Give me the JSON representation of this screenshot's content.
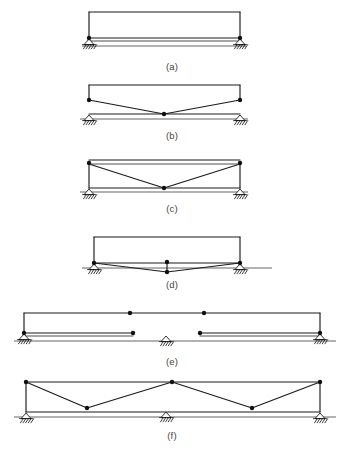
{
  "figure": {
    "background_color": "#ffffff",
    "line_color": "#1a1a1a",
    "joint_color": "#101010",
    "caption_color": "#444444",
    "width": 347,
    "height": 449
  },
  "diagrams": [
    {
      "id": "a",
      "caption": "(a)",
      "caption_pos": {
        "x": 172,
        "y": 70
      },
      "description": "simply supported beam with top arch chord",
      "ground_line": {
        "x1": 82,
        "y1": 46,
        "x2": 246,
        "y2": 46
      },
      "members": [
        {
          "name": "top-chord",
          "points": "89,12 240,12"
        },
        {
          "name": "left-post",
          "points": "89,12 89,38"
        },
        {
          "name": "right-post",
          "points": "240,12 240,38"
        },
        {
          "name": "bottom-chord-upper",
          "points": "89,38 240,38"
        },
        {
          "name": "bottom-chord-lower",
          "points": "89,41 240,41"
        }
      ],
      "joints": [
        {
          "name": "joint-left",
          "x": 89,
          "y": 38
        },
        {
          "name": "joint-right",
          "x": 240,
          "y": 38
        }
      ],
      "supports": [
        {
          "name": "support-left-pin",
          "x": 89,
          "y": 39,
          "type": "pin"
        },
        {
          "name": "support-right-pin",
          "x": 240,
          "y": 39,
          "type": "pin"
        }
      ]
    },
    {
      "id": "b",
      "caption": "(b)",
      "caption_pos": {
        "x": 172,
        "y": 139
      },
      "description": "trussed beam with single depressed centre node",
      "ground_line": {
        "x1": 80,
        "y1": 119,
        "x2": 248,
        "y2": 119
      },
      "members": [
        {
          "name": "top-chord",
          "points": "89,85 240,85"
        },
        {
          "name": "left-post",
          "points": "89,85 89,100"
        },
        {
          "name": "right-post",
          "points": "240,85 240,100"
        },
        {
          "name": "bottom-chord",
          "points": "89,114 240,114"
        },
        {
          "name": "diagonal-left",
          "points": "89,100 164,114"
        },
        {
          "name": "diagonal-right",
          "points": "164,114 240,100"
        }
      ],
      "joints": [
        {
          "name": "joint-left",
          "x": 89,
          "y": 100
        },
        {
          "name": "joint-right",
          "x": 240,
          "y": 100
        },
        {
          "name": "joint-centre",
          "x": 164,
          "y": 114
        }
      ],
      "supports": [
        {
          "name": "support-left-pin",
          "x": 89,
          "y": 115,
          "type": "pin"
        },
        {
          "name": "support-right-roller",
          "x": 240,
          "y": 115,
          "type": "roller"
        }
      ]
    },
    {
      "id": "c",
      "caption": "(c)",
      "caption_pos": {
        "x": 172,
        "y": 212
      },
      "description": "king post truss with vertical end posts to ground",
      "ground_line": {
        "x1": 80,
        "y1": 192,
        "x2": 248,
        "y2": 192
      },
      "members": [
        {
          "name": "top-chord-upper",
          "points": "89,160 240,160"
        },
        {
          "name": "top-chord-lower",
          "points": "89,164 240,164"
        },
        {
          "name": "left-post",
          "points": "89,164 89,188"
        },
        {
          "name": "right-post",
          "points": "240,164 240,188"
        },
        {
          "name": "bottom-chord",
          "points": "89,188 240,188"
        },
        {
          "name": "diagonal-left",
          "points": "89,164 164,188"
        },
        {
          "name": "diagonal-right",
          "points": "164,188 240,164"
        }
      ],
      "joints": [
        {
          "name": "joint-left",
          "x": 89,
          "y": 163
        },
        {
          "name": "joint-right",
          "x": 240,
          "y": 163
        },
        {
          "name": "joint-centre",
          "x": 164,
          "y": 188
        }
      ],
      "supports": [
        {
          "name": "support-left-pin",
          "x": 89,
          "y": 189,
          "type": "pin"
        },
        {
          "name": "support-right-roller",
          "x": 240,
          "y": 189,
          "type": "roller"
        }
      ]
    },
    {
      "id": "d",
      "caption": "(d)",
      "caption_pos": {
        "x": 172,
        "y": 288
      },
      "description": "trussed beam with short vertical hanger at midspan",
      "ground_line": {
        "x1": 82,
        "y1": 268,
        "x2": 272,
        "y2": 268
      },
      "members": [
        {
          "name": "top-chord",
          "points": "94,237 240,237"
        },
        {
          "name": "left-post",
          "points": "94,237 94,263"
        },
        {
          "name": "right-post",
          "points": "240,237 240,263"
        },
        {
          "name": "bottom-chord",
          "points": "94,263 240,263"
        },
        {
          "name": "diagonal-left",
          "points": "94,263 167,272"
        },
        {
          "name": "diagonal-right",
          "points": "167,272 240,263"
        },
        {
          "name": "hanger",
          "points": "167,262 167,272"
        }
      ],
      "joints": [
        {
          "name": "joint-left",
          "x": 94,
          "y": 263
        },
        {
          "name": "joint-right",
          "x": 240,
          "y": 263
        },
        {
          "name": "joint-centre-top",
          "x": 167,
          "y": 262
        },
        {
          "name": "joint-centre-bottom",
          "x": 167,
          "y": 272
        }
      ],
      "supports": [
        {
          "name": "support-left-pin",
          "x": 94,
          "y": 264,
          "type": "pin"
        },
        {
          "name": "support-right-roller",
          "x": 240,
          "y": 264,
          "type": "roller"
        }
      ]
    },
    {
      "id": "e",
      "caption": "(e)",
      "caption_pos": {
        "x": 172,
        "y": 365
      },
      "description": "two span beam with internal hinges and suspended span",
      "ground_line": {
        "x1": 14,
        "y1": 341,
        "x2": 336,
        "y2": 341
      },
      "members": [
        {
          "name": "top-chord-left",
          "points": "24,313 130,313"
        },
        {
          "name": "top-chord-right",
          "points": "204,313 320,313"
        },
        {
          "name": "top-chord-drop-left",
          "points": "24,313 24,333"
        },
        {
          "name": "top-chord-drop-right",
          "points": "320,313 320,333"
        },
        {
          "name": "suspended-top-link",
          "points": "130,313 204,313"
        },
        {
          "name": "bottom-chord-left",
          "points": "24,333 133,333"
        },
        {
          "name": "bottom-chord-right",
          "points": "200,333 320,333"
        },
        {
          "name": "bottom-chord-thin-left",
          "points": "24,336 133,336"
        },
        {
          "name": "bottom-chord-thin-right",
          "points": "200,336 320,336"
        }
      ],
      "joints": [
        {
          "name": "joint-left-support",
          "x": 24,
          "y": 333
        },
        {
          "name": "joint-right-support",
          "x": 320,
          "y": 333
        },
        {
          "name": "joint-hinge-top-left",
          "x": 130,
          "y": 313
        },
        {
          "name": "joint-hinge-top-right",
          "x": 204,
          "y": 313
        },
        {
          "name": "joint-hinge-bottom-left",
          "x": 133,
          "y": 333
        },
        {
          "name": "joint-hinge-bottom-right",
          "x": 200,
          "y": 333
        }
      ],
      "supports": [
        {
          "name": "support-left-pin",
          "x": 24,
          "y": 334,
          "type": "pin"
        },
        {
          "name": "support-middle-roller",
          "x": 166,
          "y": 336,
          "type": "roller"
        },
        {
          "name": "support-right-pin",
          "x": 320,
          "y": 334,
          "type": "pin"
        }
      ]
    },
    {
      "id": "f",
      "caption": "(f)",
      "caption_pos": {
        "x": 172,
        "y": 439
      },
      "description": "W truss with zigzag web over three supports",
      "ground_line": {
        "x1": 14,
        "y1": 417,
        "x2": 336,
        "y2": 417
      },
      "members": [
        {
          "name": "top-chord",
          "points": "26,382 320,382"
        },
        {
          "name": "left-post",
          "points": "26,382 26,412"
        },
        {
          "name": "right-post",
          "points": "320,382 320,412"
        },
        {
          "name": "bottom-chord",
          "points": "26,412 320,412"
        },
        {
          "name": "web-1",
          "points": "26,382 87,408"
        },
        {
          "name": "web-2",
          "points": "87,408 172,382"
        },
        {
          "name": "web-3",
          "points": "172,382 252,408"
        },
        {
          "name": "web-4",
          "points": "252,408 320,382"
        }
      ],
      "joints": [
        {
          "name": "joint-left-top",
          "x": 26,
          "y": 382
        },
        {
          "name": "joint-right-top",
          "x": 320,
          "y": 382
        },
        {
          "name": "joint-apex-centre",
          "x": 172,
          "y": 382
        },
        {
          "name": "joint-web-left",
          "x": 87,
          "y": 408
        },
        {
          "name": "joint-web-right",
          "x": 252,
          "y": 408
        }
      ],
      "supports": [
        {
          "name": "support-left-pin",
          "x": 26,
          "y": 413,
          "type": "pin"
        },
        {
          "name": "support-middle-roller",
          "x": 166,
          "y": 412,
          "type": "roller"
        },
        {
          "name": "support-right-pin",
          "x": 320,
          "y": 413,
          "type": "pin"
        }
      ]
    }
  ]
}
